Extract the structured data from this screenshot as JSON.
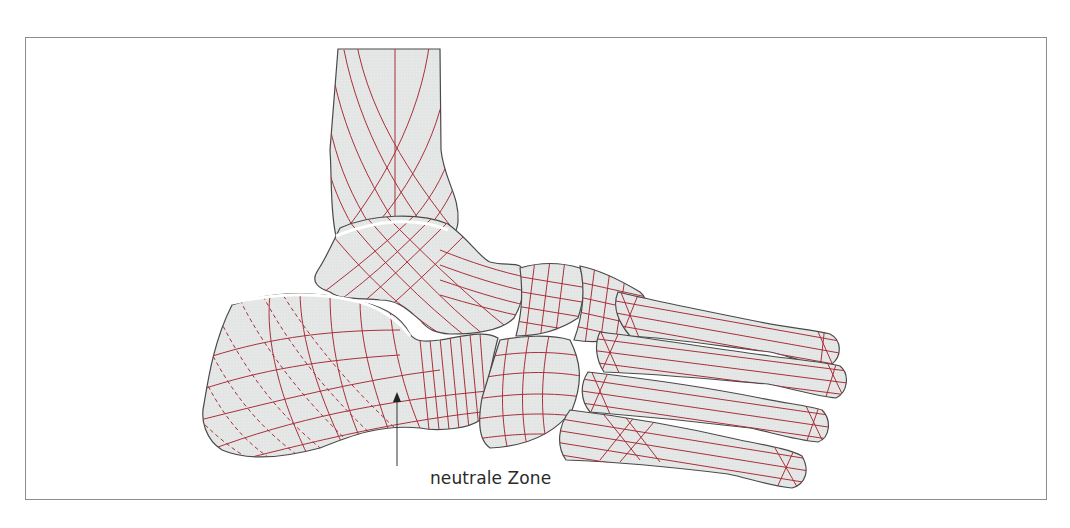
{
  "figure": {
    "label_text": "neutrale Zone",
    "caption_partial": "",
    "colors": {
      "bone_fill": "#e4e6e6",
      "bone_outline": "#4a4a4a",
      "trajectory_lines": "#a8303a",
      "frame_border": "#8c8c8c",
      "background": "#ffffff"
    },
    "parts": [
      "tibia",
      "talus",
      "calcaneus",
      "navicular",
      "cuboid",
      "cuneiforms",
      "metatarsals"
    ]
  }
}
